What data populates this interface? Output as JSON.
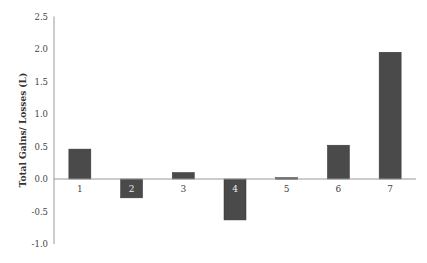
{
  "chart_data": {
    "type": "bar",
    "title": "",
    "xlabel": "",
    "ylabel": "Total Gains/ Losses (L)",
    "categories": [
      "1",
      "2",
      "3",
      "4",
      "5",
      "6",
      "7"
    ],
    "values": [
      0.46,
      -0.29,
      0.1,
      -0.63,
      0.02,
      0.52,
      1.95
    ],
    "ylim": [
      -1.0,
      2.5
    ],
    "yticks": [
      "2.5",
      "2.0",
      "1.5",
      "1.0",
      "0.5",
      "0.0",
      "-0.5",
      "-1.0"
    ],
    "grid": false,
    "legend": null,
    "bar_color": "#4a4a4a"
  }
}
